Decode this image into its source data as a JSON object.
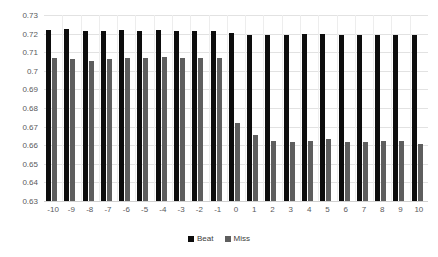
{
  "chart_data": {
    "type": "bar",
    "title": "",
    "subtitle": "",
    "xlabel": "",
    "ylabel": "",
    "grid": true,
    "legend_position": "bottom",
    "ylim": [
      0.63,
      0.73
    ],
    "ytick_labels": [
      "0.73",
      "0.72",
      "0.71",
      "0.7",
      "0.69",
      "0.68",
      "0.67",
      "0.66",
      "0.65",
      "0.64",
      "0.63"
    ],
    "ytick_values": [
      0.73,
      0.72,
      0.71,
      0.7,
      0.69,
      0.68,
      0.67,
      0.66,
      0.65,
      0.64,
      0.63
    ],
    "categories": [
      "-10",
      "-9",
      "-8",
      "-7",
      "-6",
      "-5",
      "-4",
      "-3",
      "-2",
      "-1",
      "0",
      "1",
      "2",
      "3",
      "4",
      "5",
      "6",
      "7",
      "8",
      "9",
      "10"
    ],
    "series": [
      {
        "name": "Beat",
        "color": "#0d0d0d",
        "values": [
          0.722,
          0.7225,
          0.7215,
          0.7215,
          0.722,
          0.7215,
          0.722,
          0.7215,
          0.7215,
          0.7215,
          0.7205,
          0.7195,
          0.719,
          0.7195,
          0.72,
          0.72,
          0.7195,
          0.7195,
          0.7195,
          0.719,
          0.7195
        ]
      },
      {
        "name": "Miss",
        "color": "#5e5e5e",
        "values": [
          0.707,
          0.7065,
          0.7055,
          0.7065,
          0.707,
          0.707,
          0.7075,
          0.707,
          0.707,
          0.707,
          0.672,
          0.6655,
          0.662,
          0.6615,
          0.6625,
          0.6635,
          0.6615,
          0.6615,
          0.6625,
          0.662,
          0.6605
        ]
      }
    ]
  },
  "legend": {
    "items": [
      {
        "label": "Beat",
        "color": "#0d0d0d"
      },
      {
        "label": "Miss",
        "color": "#5e5e5e"
      }
    ]
  }
}
